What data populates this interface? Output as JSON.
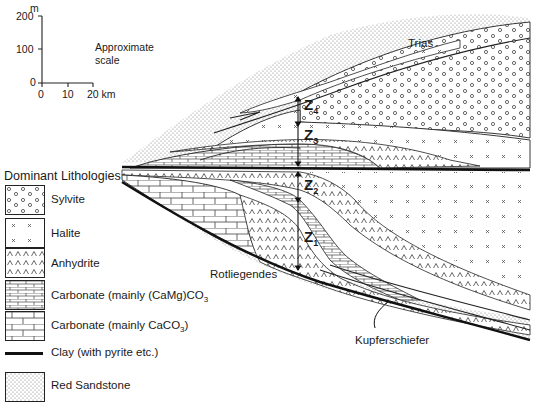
{
  "scale_bar": {
    "vertical_unit": "m",
    "vertical_ticks": [
      "200",
      "100",
      "0"
    ],
    "horizontal_ticks": [
      "0",
      "10",
      "20 km"
    ],
    "label_line1": "Approximate",
    "label_line2": "scale"
  },
  "section_labels": {
    "trias": "Trias",
    "rotliegendes": "Rotliegendes",
    "kupferschiefer": "Kupferschiefer",
    "cycles": [
      {
        "id": "Z",
        "sub": "4"
      },
      {
        "id": "Z",
        "sub": "3"
      },
      {
        "id": "Z",
        "sub": "2"
      },
      {
        "id": "Z",
        "sub": "1"
      }
    ]
  },
  "legend": {
    "title": "Dominant Lithologies",
    "items": [
      {
        "label": "Sylvite",
        "pattern": "circles"
      },
      {
        "label": "Halite",
        "pattern": "crosses"
      },
      {
        "label": "Anhydrite",
        "pattern": "carets"
      },
      {
        "label": "Carbonate  (mainly (CaMg)CO",
        "sub": "3",
        "pattern": "fine-bricks"
      },
      {
        "label": "Carbonate (mainly CaCO",
        "sub": "3",
        "tail": ")",
        "pattern": "bricks"
      },
      {
        "label": "Clay (with pyrite etc.)",
        "pattern": "thick-line"
      },
      {
        "label": "Red Sandstone",
        "pattern": "stipple"
      }
    ]
  },
  "colors": {
    "ink": "#1a1a1a",
    "stipple": "#9a9a9a",
    "background": "#ffffff"
  }
}
